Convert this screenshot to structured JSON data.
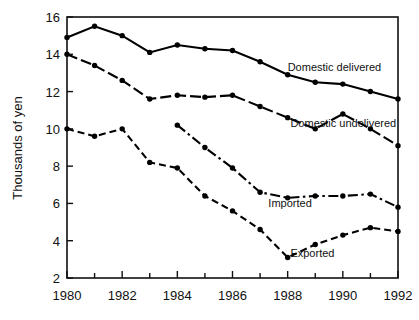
{
  "chart_data": {
    "type": "line",
    "title": "",
    "xlabel": "",
    "ylabel": "Thousands of yen",
    "xlim": [
      1980,
      1992
    ],
    "ylim": [
      2,
      16
    ],
    "grid": false,
    "legend_position": "inline-annotations",
    "x_tick_labels": [
      "1980",
      "1982",
      "1984",
      "1986",
      "1988",
      "1990",
      "1992"
    ],
    "x_tick_values": [
      1980,
      1982,
      1984,
      1986,
      1988,
      1990,
      1992
    ],
    "x_minor_ticks": [
      1981,
      1983,
      1985,
      1987,
      1989,
      1991
    ],
    "y_tick_labels": [
      "2",
      "4",
      "6",
      "8",
      "10",
      "12",
      "14",
      "16"
    ],
    "y_tick_values": [
      2,
      4,
      6,
      8,
      10,
      12,
      14,
      16
    ],
    "series": [
      {
        "name": "Domestic delivered",
        "line_style": "solid",
        "label_x": 1988.0,
        "label_y": 13.1,
        "x": [
          1980,
          1981,
          1982,
          1983,
          1984,
          1985,
          1986,
          1987,
          1988,
          1989,
          1990,
          1991,
          1992
        ],
        "values": [
          14.9,
          15.5,
          15.0,
          14.1,
          14.5,
          14.3,
          14.2,
          13.6,
          12.9,
          12.5,
          12.4,
          12.0,
          11.6
        ]
      },
      {
        "name": "Domestic undelivered",
        "line_style": "dashed",
        "label_x": 1988.1,
        "label_y": 10.1,
        "x": [
          1980,
          1981,
          1982,
          1983,
          1984,
          1985,
          1986,
          1987,
          1988,
          1989,
          1990,
          1991,
          1992
        ],
        "values": [
          14.0,
          13.4,
          12.6,
          11.6,
          11.8,
          11.7,
          11.8,
          11.2,
          10.6,
          10.0,
          10.8,
          10.0,
          9.1
        ]
      },
      {
        "name": "Imported",
        "line_style": "dashdot",
        "label_x": 1987.3,
        "label_y": 5.8,
        "x": [
          1984,
          1985,
          1986,
          1987,
          1988,
          1989,
          1990,
          1991,
          1992
        ],
        "values": [
          10.2,
          9.0,
          7.9,
          6.6,
          6.3,
          6.4,
          6.4,
          6.5,
          5.8
        ]
      },
      {
        "name": "Exported",
        "line_style": "dotted",
        "label_x": 1988.1,
        "label_y": 3.1,
        "x": [
          1980,
          1981,
          1982,
          1983,
          1984,
          1985,
          1986,
          1987,
          1988,
          1989,
          1990,
          1991,
          1992
        ],
        "values": [
          10.0,
          9.6,
          10.0,
          8.2,
          7.9,
          6.4,
          5.6,
          4.6,
          3.1,
          3.8,
          4.3,
          4.7,
          4.5
        ]
      }
    ]
  },
  "colors": {
    "ink": "#111111",
    "line": "#000000",
    "background": "#ffffff"
  }
}
